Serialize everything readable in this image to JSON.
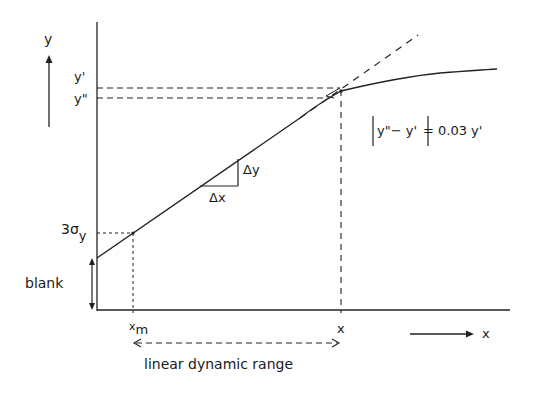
{
  "diagram": {
    "axes": {
      "y_label": "y",
      "x_label": "x",
      "y_arrow": "up-arrow",
      "x_arrow": "right-arrow"
    },
    "y_ticks": {
      "y_prime": "y'",
      "y_double_prime": "y\"",
      "three_sigma": "3σ",
      "three_sigma_sub": "y"
    },
    "x_ticks": {
      "x_m": "x",
      "x_m_sub": "m",
      "x_limit": "x"
    },
    "annotations": {
      "blank": "blank",
      "delta_x": "Δx",
      "delta_y": "Δy",
      "formula": "|y\" − y'| = 0.03 y'",
      "range_label": "linear dynamic range"
    },
    "curves": {
      "response": "solid calibration curve (linear then saturating)",
      "extrapolation": "dashed linear extrapolation"
    }
  }
}
